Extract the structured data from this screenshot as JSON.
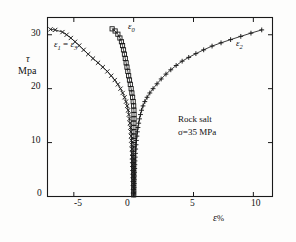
{
  "figure": {
    "background_color": "#fdfdfc",
    "ink_color": "#1a1a1a"
  },
  "axes": {
    "y_title_line1": "τ",
    "y_title_line2": "Mpa",
    "x_title_symbol": "ε",
    "x_title_unit": "%"
  },
  "annotations": {
    "material": "Rock salt",
    "confining": "σ=35 MPa"
  },
  "labels": {
    "curve_left_main": "ε",
    "curve_left_sub1": "1",
    "curve_left_eq": " = ",
    "curve_left_main2": "ε",
    "curve_left_sub2": "3",
    "curve_mid_main": "ε",
    "curve_mid_sub": "0",
    "curve_right_main": "ε",
    "curve_right_sub": "2"
  },
  "ticks": {
    "y": [
      "0",
      "10",
      "20",
      "30"
    ],
    "x": [
      "-5",
      "0",
      "5",
      "10"
    ]
  },
  "chart_data": {
    "type": "line",
    "title": "",
    "subtitle": "",
    "xlabel": "ε%",
    "ylabel": "τ Mpa",
    "xlim": [
      -7.2,
      11.6
    ],
    "ylim": [
      0,
      33.2
    ],
    "xticks": [
      -5,
      0,
      5,
      10
    ],
    "yticks": [
      0,
      10,
      20,
      30
    ],
    "grid": false,
    "frame": "box",
    "tick_direction": "in",
    "legend": "inline-annotations",
    "annotations": [
      {
        "text": "Rock salt",
        "x": 6.0,
        "y": 13.0
      },
      {
        "text": "σ=35 MPa",
        "x": 6.2,
        "y": 11.2
      },
      {
        "text": "ε₁ = ε₃",
        "x": -5.0,
        "y": 29.0
      },
      {
        "text": "ε₀",
        "x": -0.35,
        "y": 31.4
      },
      {
        "text": "ε₂",
        "x": 8.3,
        "y": 29.3
      }
    ],
    "series": [
      {
        "name": "ε₁ = ε₃",
        "marker": "x",
        "line": true,
        "points": [
          [
            -0.02,
            0.3
          ],
          [
            -0.03,
            1.0
          ],
          [
            -0.04,
            1.7
          ],
          [
            -0.05,
            2.4
          ],
          [
            -0.06,
            3.1
          ],
          [
            -0.07,
            3.8
          ],
          [
            -0.08,
            4.5
          ],
          [
            -0.09,
            5.2
          ],
          [
            -0.1,
            5.9
          ],
          [
            -0.11,
            6.6
          ],
          [
            -0.12,
            7.3
          ],
          [
            -0.13,
            8.0
          ],
          [
            -0.15,
            8.8
          ],
          [
            -0.17,
            9.6
          ],
          [
            -0.19,
            10.4
          ],
          [
            -0.21,
            11.2
          ],
          [
            -0.24,
            12.0
          ],
          [
            -0.27,
            12.8
          ],
          [
            -0.31,
            13.6
          ],
          [
            -0.35,
            14.4
          ],
          [
            -0.4,
            15.2
          ],
          [
            -0.46,
            16.0
          ],
          [
            -0.54,
            16.8
          ],
          [
            -0.64,
            17.6
          ],
          [
            -0.76,
            18.4
          ],
          [
            -0.92,
            19.2
          ],
          [
            -1.1,
            20.0
          ],
          [
            -1.32,
            20.8
          ],
          [
            -1.58,
            21.6
          ],
          [
            -1.88,
            22.4
          ],
          [
            -2.2,
            23.2
          ],
          [
            -2.58,
            24.0
          ],
          [
            -2.98,
            24.8
          ],
          [
            -3.4,
            25.6
          ],
          [
            -3.8,
            26.4
          ],
          [
            -4.18,
            27.2
          ],
          [
            -4.55,
            28.0
          ],
          [
            -4.9,
            28.7
          ],
          [
            -5.25,
            29.4
          ],
          [
            -5.6,
            30.0
          ],
          [
            -5.95,
            30.5
          ],
          [
            -6.55,
            30.9
          ],
          [
            -6.95,
            31.0
          ]
        ]
      },
      {
        "name": "ε₀",
        "marker": "square",
        "line": true,
        "points": [
          [
            0.0,
            0.3
          ],
          [
            0.0,
            1.0
          ],
          [
            0.0,
            1.7
          ],
          [
            0.0,
            2.4
          ],
          [
            0.0,
            3.1
          ],
          [
            0.0,
            3.8
          ],
          [
            0.0,
            4.5
          ],
          [
            0.0,
            5.2
          ],
          [
            0.0,
            5.9
          ],
          [
            0.0,
            6.6
          ],
          [
            0.0,
            7.3
          ],
          [
            0.0,
            8.0
          ],
          [
            0.01,
            8.8
          ],
          [
            0.01,
            9.6
          ],
          [
            0.01,
            10.4
          ],
          [
            0.01,
            11.2
          ],
          [
            0.02,
            12.0
          ],
          [
            0.02,
            12.8
          ],
          [
            0.02,
            13.6
          ],
          [
            0.03,
            14.4
          ],
          [
            0.03,
            15.2
          ],
          [
            0.02,
            16.0
          ],
          [
            0.0,
            16.8
          ],
          [
            -0.04,
            17.6
          ],
          [
            -0.09,
            18.4
          ],
          [
            -0.15,
            19.2
          ],
          [
            -0.21,
            20.0
          ],
          [
            -0.28,
            20.8
          ],
          [
            -0.35,
            21.6
          ],
          [
            -0.42,
            22.4
          ],
          [
            -0.49,
            23.2
          ],
          [
            -0.56,
            24.0
          ],
          [
            -0.63,
            24.8
          ],
          [
            -0.7,
            25.6
          ],
          [
            -0.77,
            26.4
          ],
          [
            -0.85,
            27.2
          ],
          [
            -0.93,
            28.0
          ],
          [
            -1.02,
            28.7
          ],
          [
            -1.15,
            29.4
          ],
          [
            -1.32,
            30.1
          ],
          [
            -1.55,
            30.7
          ],
          [
            -1.8,
            31.1
          ]
        ]
      },
      {
        "name": "ε₂",
        "marker": "plus",
        "line": true,
        "points": [
          [
            0.02,
            0.3
          ],
          [
            0.03,
            1.0
          ],
          [
            0.04,
            1.7
          ],
          [
            0.05,
            2.4
          ],
          [
            0.06,
            3.1
          ],
          [
            0.07,
            3.8
          ],
          [
            0.08,
            4.5
          ],
          [
            0.09,
            5.2
          ],
          [
            0.1,
            5.9
          ],
          [
            0.11,
            6.6
          ],
          [
            0.13,
            7.3
          ],
          [
            0.15,
            8.0
          ],
          [
            0.17,
            8.8
          ],
          [
            0.2,
            9.6
          ],
          [
            0.23,
            10.4
          ],
          [
            0.27,
            11.2
          ],
          [
            0.31,
            12.0
          ],
          [
            0.36,
            12.8
          ],
          [
            0.42,
            13.6
          ],
          [
            0.49,
            14.4
          ],
          [
            0.57,
            15.2
          ],
          [
            0.66,
            16.0
          ],
          [
            0.78,
            16.8
          ],
          [
            0.93,
            17.6
          ],
          [
            1.12,
            18.4
          ],
          [
            1.35,
            19.2
          ],
          [
            1.62,
            20.0
          ],
          [
            1.95,
            20.9
          ],
          [
            2.3,
            21.8
          ],
          [
            2.7,
            22.7
          ],
          [
            3.1,
            23.5
          ],
          [
            3.55,
            24.3
          ],
          [
            4.05,
            25.1
          ],
          [
            4.6,
            25.8
          ],
          [
            5.2,
            26.5
          ],
          [
            5.85,
            27.2
          ],
          [
            6.55,
            27.9
          ],
          [
            7.3,
            28.5
          ],
          [
            8.1,
            29.1
          ],
          [
            8.95,
            29.7
          ],
          [
            9.8,
            30.3
          ],
          [
            10.7,
            30.9
          ]
        ]
      }
    ]
  }
}
